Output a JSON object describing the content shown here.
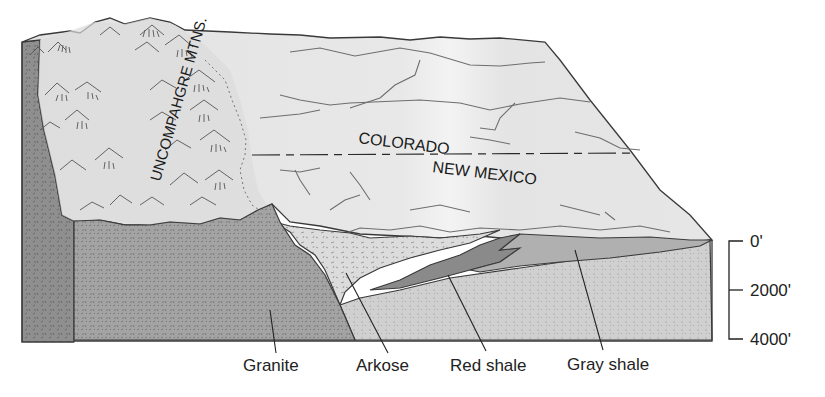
{
  "diagram": {
    "type": "geologic block diagram",
    "map_labels": {
      "mountains": "UNCOMPAHGRE MTNS.",
      "north_state": "COLORADO",
      "south_state": "NEW MEXICO"
    },
    "rock_units": [
      {
        "label": "Granite",
        "fill": "#a3a3a3"
      },
      {
        "label": "Arkose",
        "fill": "#d9d9d9"
      },
      {
        "label": "Red shale",
        "fill": "#8a8a8a"
      },
      {
        "label": "Gray shale",
        "fill": "#b0b0b0"
      }
    ],
    "depth_scale": {
      "ticks": [
        "0'",
        "2000'",
        "4000'"
      ]
    },
    "colors": {
      "surface": "#e6e6e6",
      "surface_light": "#f0f0f0",
      "outline": "#3a3a3a",
      "river": "#6e6e6e",
      "side_face": "#8f8f8f",
      "lower_sandstone": "#cfcfcf"
    }
  }
}
